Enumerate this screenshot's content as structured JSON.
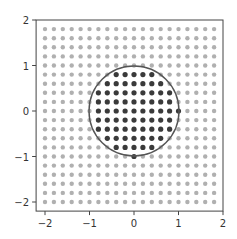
{
  "chart_data": {
    "type": "scatter",
    "title": "",
    "xlabel": "",
    "ylabel": "",
    "xlim": [
      -2.2,
      2.0
    ],
    "ylim": [
      -2.2,
      2.0
    ],
    "grid": false,
    "legend": null,
    "xticks": [
      -2,
      -1,
      0,
      1,
      2
    ],
    "yticks": [
      -2,
      -1,
      0,
      1,
      2
    ],
    "xtick_labels": [
      "−2",
      "−1",
      "0",
      "1",
      "2"
    ],
    "ytick_labels": [
      "−2",
      "−1",
      "0",
      "1",
      "2"
    ],
    "grid_points": {
      "x_start": -2.0,
      "x_end": 1.8,
      "x_step": 0.2,
      "y_start": -2.0,
      "y_end": 1.8,
      "y_step": 0.2,
      "count_per_axis": 20
    },
    "series": [
      {
        "name": "outside",
        "rule": "x^2 + y^2 >= 1",
        "color": "#b0b0b0",
        "marker": "o",
        "size": 2.2
      },
      {
        "name": "inside",
        "rule": "x^2 + y^2 < 1",
        "color": "#3a3a3a",
        "marker": "o",
        "size": 2.6
      }
    ],
    "annotations": [
      {
        "type": "circle",
        "center": [
          0,
          0
        ],
        "radius": 1,
        "color": "#555555",
        "fill": "none"
      }
    ]
  },
  "colors": {
    "outside_point": "#b0b0b0",
    "inside_point": "#3a3a3a",
    "circle": "#555555",
    "axis": "#444444",
    "text": "#333333"
  }
}
